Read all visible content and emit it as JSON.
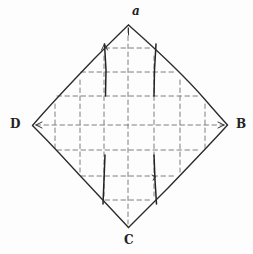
{
  "figure": {
    "type": "geometric-diagram",
    "background_color": "#fdfdfd",
    "ink_color": "#2b2b2b",
    "dash_color": "#6b6b6b",
    "labels": {
      "top": "a",
      "right": "B",
      "bottom": "C",
      "left": "D"
    },
    "vertices": {
      "top": {
        "name": "a",
        "x": 128,
        "y": 24
      },
      "right": {
        "name": "B",
        "x": 228,
        "y": 125
      },
      "bottom": {
        "name": "C",
        "x": 128,
        "y": 228
      },
      "left": {
        "name": "D",
        "x": 32,
        "y": 125
      }
    },
    "grid": {
      "style": "dashed",
      "vertical_x": [
        55,
        80,
        104,
        128,
        154,
        180,
        205
      ],
      "horizontal_y": [
        48,
        72,
        96,
        125,
        150,
        176,
        200
      ],
      "cell_size": 25
    },
    "solid_segments": [
      {
        "name": "top-left-fold",
        "x1": 104,
        "y1": 44,
        "x2": 106,
        "y2": 96
      },
      {
        "name": "top-right-fold",
        "x1": 156,
        "y1": 44,
        "x2": 154,
        "y2": 96
      },
      {
        "name": "bottom-left-fold",
        "x1": 105,
        "y1": 155,
        "x2": 103,
        "y2": 204
      },
      {
        "name": "bottom-right-fold",
        "x1": 154,
        "y1": 155,
        "x2": 156,
        "y2": 204
      }
    ],
    "arrow_marks": [
      {
        "name": "apex-tick",
        "x": 128,
        "y": 32
      },
      {
        "name": "left-vertex-tick",
        "x": 40,
        "y": 125
      },
      {
        "name": "right-vertex-tick",
        "x": 220,
        "y": 125
      },
      {
        "name": "top-left-arrow",
        "x": 104,
        "y": 44
      },
      {
        "name": "bottom-right-arrow",
        "x": 156,
        "y": 178
      }
    ]
  }
}
